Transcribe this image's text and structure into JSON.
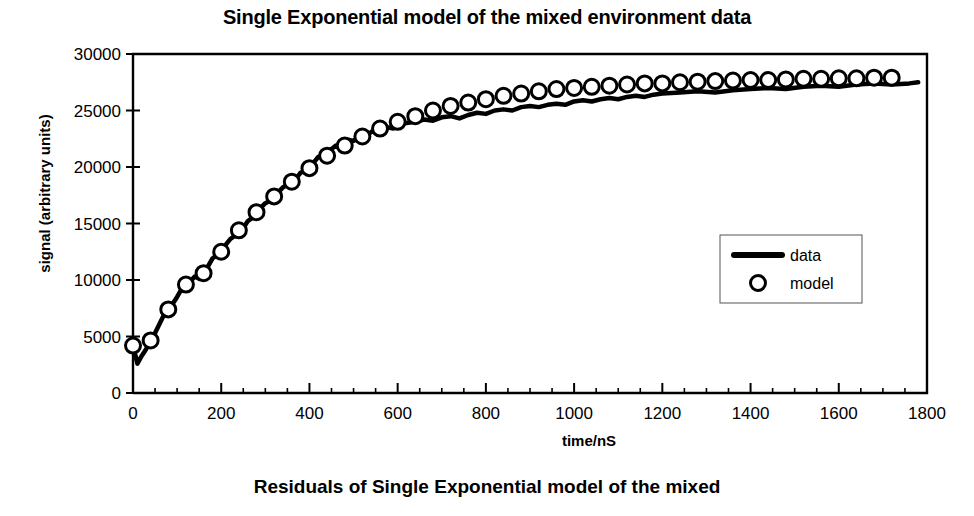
{
  "figure": {
    "title": "Single Exponential model of the mixed environment data",
    "bottom_caption": "Residuals of Single Exponential model of the mixed"
  },
  "chart_data": {
    "type": "line",
    "title": "Single Exponential model of the mixed environment data",
    "xlabel": "time/nS",
    "ylabel": "signal (arbitrary units)",
    "xlim": [
      0,
      1800
    ],
    "ylim": [
      0,
      30000
    ],
    "xticks": [
      0,
      200,
      400,
      600,
      800,
      1000,
      1200,
      1400,
      1600,
      1800
    ],
    "yticks": [
      0,
      5000,
      10000,
      15000,
      20000,
      25000,
      30000
    ],
    "xminor_step": 50,
    "grid": false,
    "legend_position": "center-right",
    "legend": [
      "data",
      "model"
    ],
    "line_color": "#000000",
    "marker_color": "#000000",
    "series": [
      {
        "name": "data",
        "style": "thick-noisy-line",
        "x": [
          0,
          10,
          20,
          30,
          40,
          50,
          60,
          70,
          80,
          90,
          100,
          110,
          120,
          130,
          140,
          150,
          160,
          170,
          180,
          190,
          200,
          210,
          220,
          230,
          240,
          250,
          260,
          270,
          280,
          290,
          300,
          310,
          320,
          330,
          340,
          350,
          360,
          370,
          380,
          390,
          400,
          410,
          420,
          430,
          440,
          450,
          460,
          470,
          480,
          490,
          500,
          510,
          520,
          530,
          540,
          550,
          560,
          570,
          580,
          590,
          600,
          620,
          640,
          660,
          680,
          700,
          720,
          740,
          760,
          780,
          800,
          820,
          840,
          860,
          880,
          900,
          920,
          940,
          960,
          980,
          1000,
          1020,
          1040,
          1060,
          1080,
          1100,
          1120,
          1140,
          1160,
          1180,
          1200,
          1240,
          1280,
          1320,
          1360,
          1400,
          1440,
          1480,
          1520,
          1560,
          1600,
          1640,
          1680,
          1720,
          1760,
          1780
        ],
        "y": [
          4200,
          2600,
          3300,
          3900,
          4600,
          5300,
          6100,
          6900,
          7400,
          7900,
          8500,
          9200,
          9700,
          9900,
          10300,
          10100,
          10500,
          11200,
          11900,
          12200,
          12500,
          13100,
          13600,
          13900,
          14400,
          14600,
          15200,
          15500,
          16100,
          16400,
          16800,
          17000,
          17500,
          17800,
          18200,
          18400,
          18800,
          19000,
          19500,
          19700,
          20200,
          20400,
          20900,
          21000,
          21400,
          21600,
          21900,
          21700,
          22100,
          22400,
          22300,
          22600,
          22900,
          22800,
          23100,
          23200,
          23000,
          23300,
          23500,
          23400,
          23700,
          23900,
          24000,
          24200,
          24100,
          24400,
          24500,
          24300,
          24600,
          24800,
          24700,
          25000,
          25100,
          25000,
          25300,
          25400,
          25300,
          25500,
          25600,
          25500,
          25800,
          25900,
          25800,
          26000,
          26100,
          26000,
          26200,
          26300,
          26200,
          26400,
          26500,
          26600,
          26700,
          26600,
          26800,
          26900,
          27000,
          26900,
          27100,
          27200,
          27100,
          27300,
          27400,
          27300,
          27400,
          27500
        ]
      },
      {
        "name": "model",
        "style": "open-circle-markers",
        "x": [
          0,
          40,
          80,
          120,
          160,
          200,
          240,
          280,
          320,
          360,
          400,
          440,
          480,
          520,
          560,
          600,
          640,
          680,
          720,
          760,
          800,
          840,
          880,
          920,
          960,
          1000,
          1040,
          1080,
          1120,
          1160,
          1200,
          1240,
          1280,
          1320,
          1360,
          1400,
          1440,
          1480,
          1520,
          1560,
          1600,
          1640,
          1680,
          1720
        ],
        "y": [
          4200,
          4650,
          7400,
          9600,
          10600,
          12500,
          14400,
          16000,
          17400,
          18700,
          19900,
          21000,
          21900,
          22700,
          23400,
          24000,
          24500,
          25000,
          25400,
          25700,
          26000,
          26300,
          26500,
          26700,
          26900,
          27000,
          27100,
          27200,
          27300,
          27400,
          27400,
          27500,
          27550,
          27600,
          27650,
          27700,
          27700,
          27750,
          27800,
          27800,
          27850,
          27850,
          27900,
          27900
        ]
      }
    ]
  },
  "axes": {
    "plot_left_px": 133,
    "plot_right_px": 927,
    "plot_top_px": 54,
    "plot_bottom_px": 393
  }
}
